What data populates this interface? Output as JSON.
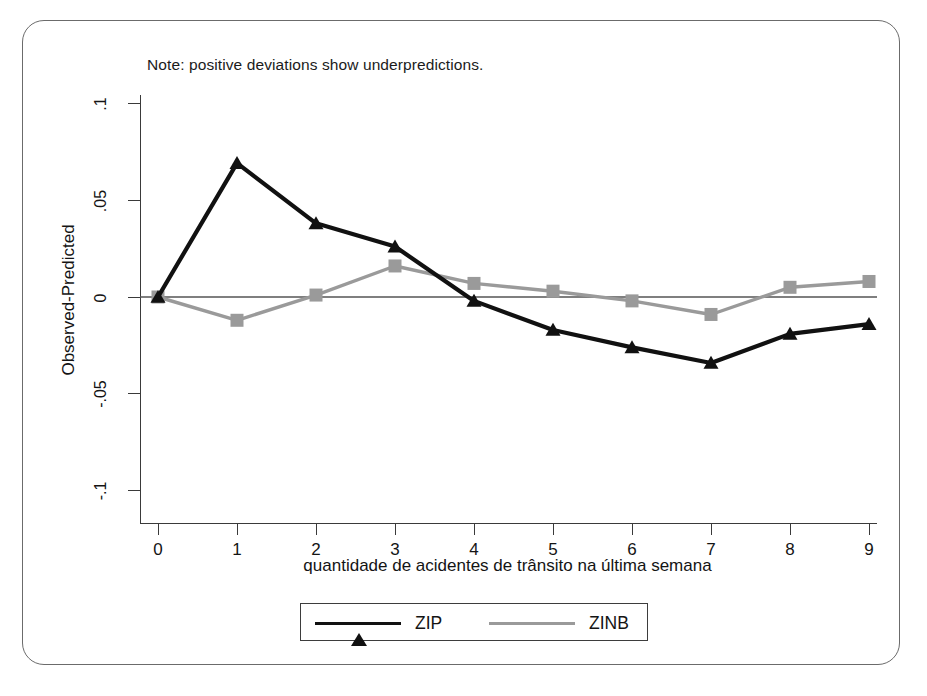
{
  "note": "Note: positive deviations show underpredictions.",
  "axes": {
    "ylabel": "Observed-Predicted",
    "xlabel": "quantidade de acidentes de trânsito na última semana",
    "yticks": [
      ".1",
      ".05",
      "0",
      "-.05",
      "-.1"
    ],
    "xticks": [
      "0",
      "1",
      "2",
      "3",
      "4",
      "5",
      "6",
      "7",
      "8",
      "9"
    ]
  },
  "legend": {
    "items": [
      {
        "label": "ZIP",
        "color": "#111111",
        "marker": "triangle"
      },
      {
        "label": "ZINB",
        "color": "#9a9a9a",
        "marker": "square"
      }
    ]
  },
  "colors": {
    "zip": "#111111",
    "zinb": "#9a9a9a",
    "axis": "#3a3a3a",
    "zeroline": "#555555",
    "frame": "#6b6b6b"
  },
  "chart_data": {
    "type": "line",
    "title": "",
    "subtitle": "Note: positive deviations show underpredictions.",
    "xlabel": "quantidade de acidentes de trânsito na última semana",
    "ylabel": "Observed-Predicted",
    "x": [
      0,
      1,
      2,
      3,
      4,
      5,
      6,
      7,
      8,
      9
    ],
    "xlim": [
      0,
      9
    ],
    "ylim": [
      -0.1,
      0.1
    ],
    "yticks": [
      0.1,
      0.05,
      0,
      -0.05,
      -0.1
    ],
    "xticks": [
      0,
      1,
      2,
      3,
      4,
      5,
      6,
      7,
      8,
      9
    ],
    "grid": false,
    "zero_reference_line": 0,
    "legend_position": "bottom",
    "series": [
      {
        "name": "ZIP",
        "color": "#111111",
        "marker": "triangle",
        "values": [
          0.0,
          0.069,
          0.038,
          0.026,
          -0.002,
          -0.017,
          -0.026,
          -0.034,
          -0.019,
          -0.014
        ]
      },
      {
        "name": "ZINB",
        "color": "#9a9a9a",
        "marker": "square",
        "values": [
          0.0,
          -0.012,
          0.001,
          0.016,
          0.007,
          0.003,
          -0.002,
          -0.009,
          0.005,
          0.008
        ]
      }
    ]
  }
}
